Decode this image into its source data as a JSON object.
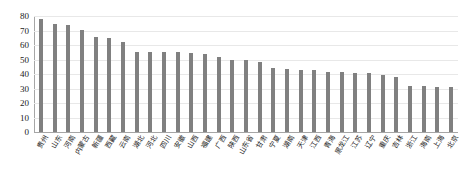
{
  "chart_data": {
    "type": "bar",
    "title": "",
    "subtitle": "",
    "xlabel": "",
    "ylabel": "",
    "ylim": [
      0,
      80
    ],
    "yticks": [
      0,
      10,
      20,
      30,
      40,
      50,
      60,
      70,
      80
    ],
    "grid": true,
    "legend": false,
    "legend_position": "none",
    "bar_color": "#808080",
    "gridline_color": "#e8e8e8",
    "axis_color": "#a6a6a6",
    "categories": [
      "贵州",
      "山东",
      "河南",
      "内蒙古",
      "新疆",
      "西藏",
      "云南",
      "湖北",
      "河北",
      "四川",
      "安徽",
      "山西",
      "福建",
      "广西",
      "陕西",
      "山东省",
      "甘肃",
      "宁夏",
      "湖南",
      "天津",
      "江西",
      "青海",
      "黑龙江",
      "江苏",
      "辽宁",
      "重庆",
      "吉林",
      "浙江",
      "海南",
      "上海",
      "北京"
    ],
    "values": [
      78,
      74.5,
      74,
      70.5,
      65.5,
      64.5,
      62,
      55.5,
      55.5,
      55,
      55,
      54.5,
      54,
      51.5,
      50,
      50,
      48.5,
      44,
      43.5,
      43,
      42.5,
      41.5,
      41.5,
      41,
      40.5,
      39.5,
      38,
      32,
      32,
      31,
      31
    ]
  }
}
